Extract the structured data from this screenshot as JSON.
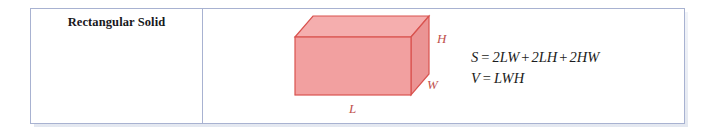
{
  "figure": {
    "row_title": "Rectangular Solid",
    "border_color": "#a8b2d1",
    "solid": {
      "fill_front": "#f2a0a0",
      "fill_top": "#f5aeae",
      "fill_side": "#eb9494",
      "edge_color": "#d9534f",
      "hidden_edge_color": "#e8948f",
      "labels": {
        "height": "H",
        "width": "W",
        "length": "L"
      },
      "label_color": "#c0504d"
    },
    "formulas": [
      {
        "name": "surface-area",
        "lhs": "S",
        "eq": "=",
        "terms": [
          "2LW",
          "2LH",
          "2HW"
        ],
        "operators": [
          "+",
          "+"
        ],
        "text": "S = 2LW + 2LH + 2HW"
      },
      {
        "name": "volume",
        "lhs": "V",
        "eq": "=",
        "terms": [
          "LWH"
        ],
        "operators": [],
        "text": "V = LWH"
      }
    ]
  }
}
